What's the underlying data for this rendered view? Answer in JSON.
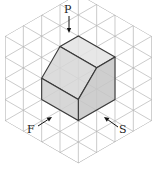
{
  "diagram": {
    "type": "isometric-projection",
    "grid": {
      "dx": 18.33,
      "dy": 21.17,
      "origin_x": 78.33,
      "origin_y": 78.5,
      "cols": 4,
      "rows": 4,
      "color": "#b4b4b4"
    },
    "faces": [
      {
        "name": "top-face",
        "points": [
          [
            60,
            46.5
          ],
          [
            78.33,
            35.9
          ],
          [
            115,
            57.1
          ],
          [
            96.67,
            67.7
          ]
        ],
        "fill": "#e3e3e3"
      },
      {
        "name": "slanted-face",
        "points": [
          [
            60,
            46.5
          ],
          [
            96.67,
            67.7
          ],
          [
            78.33,
            99.4
          ],
          [
            41.67,
            78.2
          ]
        ],
        "fill": "#d6d6d6"
      },
      {
        "name": "right-face",
        "points": [
          [
            96.67,
            67.7
          ],
          [
            115,
            57.1
          ],
          [
            115,
            99.4
          ],
          [
            78.33,
            120.6
          ],
          [
            78.33,
            99.4
          ]
        ],
        "fill": "#c6c6c6"
      },
      {
        "name": "left-face",
        "points": [
          [
            41.67,
            78.2
          ],
          [
            78.33,
            99.4
          ],
          [
            78.33,
            120.6
          ],
          [
            41.67,
            99.4
          ]
        ],
        "fill": "#d0d0d0"
      }
    ],
    "labels": {
      "top": "P",
      "front": "F",
      "side": "S"
    },
    "arrows": {
      "top": {
        "from": [
          69,
          16
        ],
        "to": [
          69,
          33
        ]
      },
      "front": {
        "from": [
          38,
          126
        ],
        "to": [
          52,
          117
        ]
      },
      "side": {
        "from": [
          118,
          127
        ],
        "to": [
          104,
          117
        ]
      }
    },
    "label_positions": {
      "top": [
        64,
        13
      ],
      "front": [
        27,
        133
      ],
      "side": [
        119,
        133
      ]
    }
  }
}
